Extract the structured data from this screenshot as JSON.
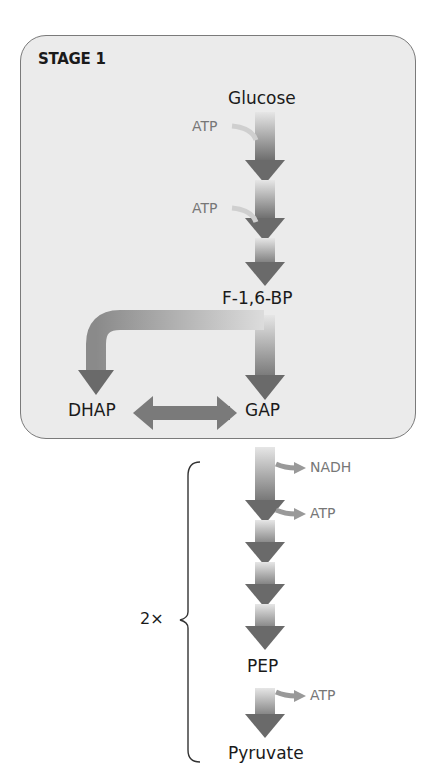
{
  "stage": {
    "title": "STAGE 1"
  },
  "metabolites": {
    "glucose": "Glucose",
    "f16bp": "F-1,6-BP",
    "dhap": "DHAP",
    "gap": "GAP",
    "pep": "PEP",
    "pyruvate": "Pyruvate"
  },
  "inputs": {
    "atp1": "ATP",
    "atp2": "ATP"
  },
  "outputs": {
    "nadh": "NADH",
    "atp3": "ATP",
    "atp4": "ATP"
  },
  "multiplier": "2×",
  "colors": {
    "box_fill": "#ebebeb",
    "box_border": "#7a7a7a",
    "arrow_dark": "#6e6e6e",
    "arrow_light": "#e4e4e4",
    "side_text": "#777777"
  }
}
